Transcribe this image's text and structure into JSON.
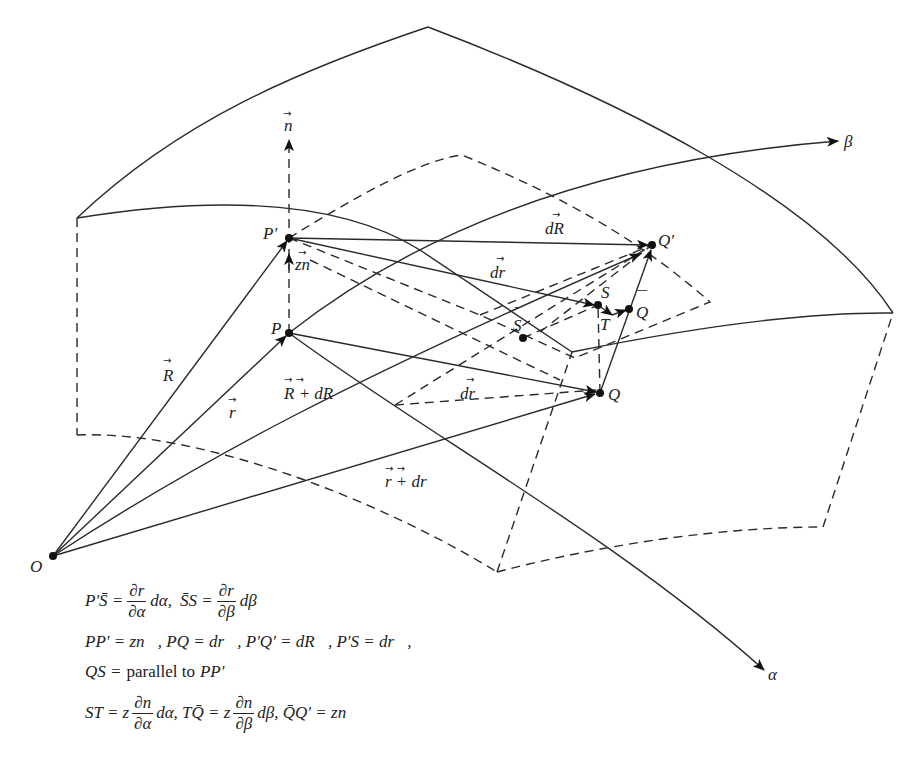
{
  "figure": {
    "type": "surface-differential-geometry-diagram",
    "axes": {
      "alpha_label": "α",
      "beta_label": "β",
      "normal_label": "n"
    },
    "points": {
      "O": "O",
      "P": "P",
      "P_prime": "P′",
      "Q": "Q",
      "Q_prime": "Q′",
      "S": "S",
      "S_bar": "S",
      "T": "T",
      "Q_bar": "Q"
    },
    "vector_labels": {
      "R": "R",
      "r": "r",
      "R_plus_dR": "R + dR",
      "r_plus_dr": "r + dr",
      "dR": "dR",
      "dr_upper": "dr",
      "dr_lower": "dr",
      "zn": "zn"
    }
  },
  "formulas": {
    "line1": "P′S̄ = (∂r⃗/∂α) dα,  S̄S = (∂r⃗/∂β) dβ",
    "line2": "PP′ = zn⃗, PQ = dr⃗, P′Q′ = dR⃗, P′S = dr⃗",
    "line3": "QS = parallel to PP′",
    "line4": "ST = z (∂n⃗/∂α) dα, TQ̄ = z (∂n⃗/∂β) dβ, Q̄Q′ = zn⃗",
    "parts": {
      "l1_a": "P′S̄ =",
      "l1_num": "∂r",
      "l1_den": "∂α",
      "l1_b": "dα,",
      "l1_c": "S̄S =",
      "l1_num2": "∂r",
      "l1_den2": "∂β",
      "l1_d": "dβ",
      "l2": "PP′ = zn⃗, PQ = dr⃗, P′Q′ = dR⃗, P′S = dr⃗,",
      "l3_a": "QS =",
      "l3_b": "parallel to",
      "l3_c": "PP′",
      "l4_a": "ST = z",
      "l4_num": "∂n",
      "l4_den": "∂α",
      "l4_b": "dα, TQ̄ = z",
      "l4_num2": "∂n",
      "l4_den2": "∂β",
      "l4_c": "dβ, Q̄Q′ = zn⃗"
    }
  }
}
